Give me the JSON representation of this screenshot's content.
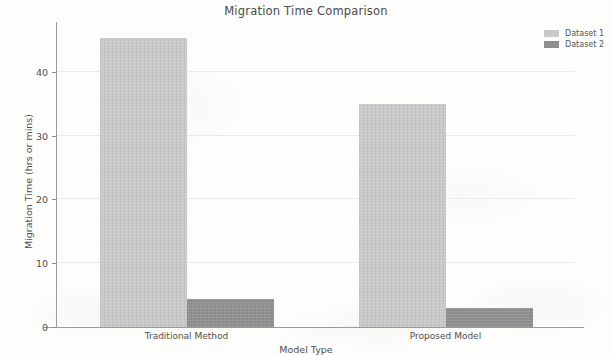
{
  "chart_data": {
    "type": "bar",
    "title": "Migration Time Comparison",
    "xlabel": "Model Type",
    "ylabel": "Migration Time (hrs or mins)",
    "categories": [
      "Traditional Method",
      "Proposed Model"
    ],
    "series": [
      {
        "name": "Dataset 1",
        "values": [
          45.3,
          35.0
        ],
        "color": "#c9c9c9"
      },
      {
        "name": "Dataset 2",
        "values": [
          4.4,
          3.0
        ],
        "color": "#8f8f8f"
      }
    ],
    "ylim": [
      0,
      47.5
    ],
    "yticks": [
      0,
      10,
      20,
      30,
      40
    ],
    "ytick_labels": [
      "0",
      "10",
      "20",
      "30",
      "40"
    ],
    "grid": true,
    "legend_position": "upper right"
  },
  "legend": {
    "entries": [
      {
        "label": "Dataset 1"
      },
      {
        "label": "Dataset 2"
      }
    ]
  }
}
